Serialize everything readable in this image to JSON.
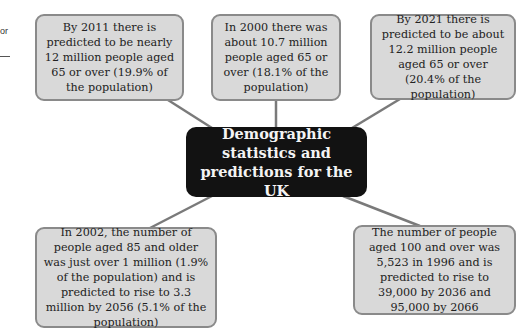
{
  "edge_fragment": {
    "text": "or"
  },
  "center": {
    "title": "Demographic statistics and predictions for the UK"
  },
  "nodes": [
    {
      "id": "top-left",
      "text": "By 2011 there is predicted to be nearly 12 million people aged 65 or over (19.9% of the population)"
    },
    {
      "id": "top-middle",
      "text": "In 2000 there was about 10.7 million people aged 65 or over (18.1% of the population)"
    },
    {
      "id": "top-right",
      "text": "By 2021 there is predicted to be about 12.2 million people aged 65 or over (20.4% of the population)"
    },
    {
      "id": "bottom-left",
      "text": "In 2002, the number of people aged 85 and older was just over 1 million (1.9% of the population) and is predicted to rise to 3.3 million by 2056 (5.1% of the population)"
    },
    {
      "id": "bottom-right",
      "text": "The number of people aged 100 and over was 5,523 in 1996 and is predicted to rise to 39,000 by 2036 and 95,000 by 2066"
    }
  ],
  "colors": {
    "node_fill": "#d9d9d9",
    "node_border": "#8a8a8a",
    "center_fill": "#121212",
    "center_text": "#f4f4f4",
    "connector": "#7a7a7a"
  }
}
